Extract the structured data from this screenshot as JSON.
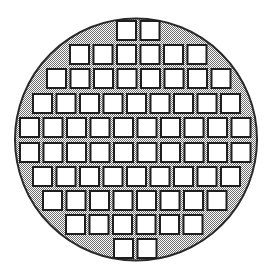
{
  "diagram": {
    "type": "wafer-map",
    "wafer": {
      "center_x": 136,
      "center_y": 139.5,
      "radius": 121,
      "edge_color": "#2a2a2a",
      "fill_pattern": "gray-dither",
      "fill_light": "#ffffff",
      "fill_dark": "#6e6e6e"
    },
    "die": {
      "width": 21,
      "height": 21,
      "pitch_x": 23.5,
      "fill": "#ffffff",
      "border_color": "#1e1e1e",
      "border_width": 2
    },
    "rows": [
      {
        "y": 20,
        "x_start": 116,
        "count": 2
      },
      {
        "y": 44,
        "x_start": 69,
        "count": 6
      },
      {
        "y": 68,
        "x_start": 46,
        "count": 8
      },
      {
        "y": 93,
        "x_start": 32,
        "count": 9
      },
      {
        "y": 117,
        "x_start": 19,
        "count": 10
      },
      {
        "y": 142,
        "x_start": 19,
        "count": 10
      },
      {
        "y": 166,
        "x_start": 32,
        "count": 9
      },
      {
        "y": 190,
        "x_start": 42,
        "count": 8
      },
      {
        "y": 214,
        "x_start": 65,
        "count": 6
      },
      {
        "y": 238,
        "x_start": 113,
        "count": 2
      }
    ],
    "total_dies": 70
  }
}
